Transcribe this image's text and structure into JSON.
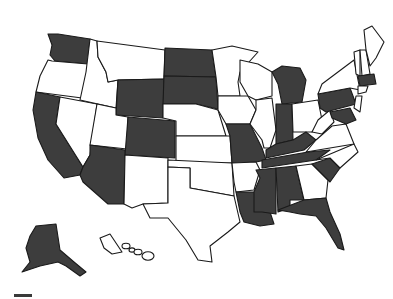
{
  "map": {
    "type": "choropleth",
    "region": "United States",
    "colors": {
      "highlighted": "#3d3d3d",
      "other": "#ffffff",
      "border": "#1a1a1a"
    },
    "highlighted_states": [
      "WA",
      "CA",
      "AZ",
      "WY",
      "CO",
      "ND",
      "SD",
      "MO",
      "MI",
      "IN",
      "KY",
      "TN",
      "MS",
      "AL",
      "LA",
      "FL",
      "SC",
      "PA",
      "MA",
      "MD",
      "AK"
    ],
    "states": [
      {
        "id": "WA",
        "fill": "highlighted",
        "points": "48,34 58,34 90,39 88,64 55,61 50,55 52,45"
      },
      {
        "id": "OR",
        "fill": "other",
        "points": "52,61 88,64 87,72 82,98 36,92 40,76 48,60"
      },
      {
        "id": "CA",
        "fill": "highlighted",
        "points": "36,92 60,97 56,124 83,167 80,175 64,178 48,160 38,138 33,110"
      },
      {
        "id": "NV",
        "fill": "other",
        "points": "60,97 97,104 90,155 83,167 56,124"
      },
      {
        "id": "ID",
        "fill": "other",
        "points": "90,39 97,41 98,57 106,72 108,82 118,80 116,108 80,100 86,72"
      },
      {
        "id": "MT",
        "fill": "other",
        "points": "97,41 165,50 164,79 118,80 108,82 106,72 98,57"
      },
      {
        "id": "WY",
        "fill": "highlighted",
        "points": "118,80 164,79 163,118 116,115"
      },
      {
        "id": "UT",
        "fill": "other",
        "points": "97,104 116,108 116,115 128,117 127,149 90,145"
      },
      {
        "id": "CO",
        "fill": "highlighted",
        "points": "128,117 175,121 175,158 125,155"
      },
      {
        "id": "AZ",
        "fill": "highlighted",
        "points": "90,145 125,150 124,204 108,204 83,182 80,175 83,167 90,155"
      },
      {
        "id": "NM",
        "fill": "other",
        "points": "125,155 168,158 168,203 143,204 132,208 124,204"
      },
      {
        "id": "ND",
        "fill": "highlighted",
        "points": "165,48 212,50 216,77 164,76"
      },
      {
        "id": "SD",
        "fill": "highlighted",
        "points": "164,76 216,77 218,109 196,104 163,104"
      },
      {
        "id": "NE",
        "fill": "other",
        "points": "163,104 196,104 218,110 226,136 176,136 176,121 163,118"
      },
      {
        "id": "KS",
        "fill": "other",
        "points": "176,136 230,136 232,163 176,163"
      },
      {
        "id": "OK",
        "fill": "other",
        "points": "168,160 232,163 234,196 212,192 190,188 190,168 168,167"
      },
      {
        "id": "TX",
        "fill": "other",
        "points": "168,167 190,168 190,188 234,196 240,222 228,232 210,246 212,262 198,260 186,240 168,218 150,218 143,204 168,203"
      },
      {
        "id": "MN",
        "fill": "other",
        "points": "212,50 232,46 258,52 240,72 238,82 240,96 218,96 216,77"
      },
      {
        "id": "IA",
        "fill": "other",
        "points": "218,96 248,96 256,110 250,124 226,124 218,110"
      },
      {
        "id": "MO",
        "fill": "highlighted",
        "points": "226,124 250,124 262,148 266,160 256,162 236,163 232,163 230,136"
      },
      {
        "id": "AR",
        "fill": "other",
        "points": "232,163 256,162 260,170 254,190 236,192 234,182"
      },
      {
        "id": "LA",
        "fill": "highlighted",
        "points": "236,192 256,192 258,210 270,212 274,224 260,226 244,222 240,212"
      },
      {
        "id": "WI",
        "fill": "other",
        "points": "240,60 258,64 272,72 272,96 256,100 248,96 240,82"
      },
      {
        "id": "IL",
        "fill": "other",
        "points": "256,100 272,98 276,130 270,148 264,148 262,140 250,124 256,110"
      },
      {
        "id": "MI",
        "fill": "highlighted",
        "points": "272,72 282,66 300,68 306,80 302,102 282,104 278,84"
      },
      {
        "id": "IN",
        "fill": "highlighted",
        "points": "276,104 292,104 293,140 276,144"
      },
      {
        "id": "OH",
        "fill": "other",
        "points": "292,104 318,100 322,120 312,132 293,132"
      },
      {
        "id": "KY",
        "fill": "highlighted",
        "points": "266,150 276,144 293,140 306,132 316,140 304,150 266,158"
      },
      {
        "id": "TN",
        "fill": "highlighted",
        "points": "262,160 308,152 330,150 316,160 262,168"
      },
      {
        "id": "MS",
        "fill": "highlighted",
        "points": "256,170 276,168 276,214 262,212 254,212 254,192 260,178"
      },
      {
        "id": "AL",
        "fill": "highlighted",
        "points": "276,168 296,166 304,200 290,200 290,208 278,212"
      },
      {
        "id": "GA",
        "fill": "other",
        "points": "296,166 312,164 328,180 326,198 304,200"
      },
      {
        "id": "FL",
        "fill": "highlighted",
        "points": "278,210 304,200 326,198 330,212 340,234 344,250 338,248 326,228 316,216 300,214 290,212"
      },
      {
        "id": "SC",
        "fill": "highlighted",
        "points": "312,164 330,158 340,168 330,182"
      },
      {
        "id": "NC",
        "fill": "other",
        "points": "316,160 354,144 358,152 340,168 330,158"
      },
      {
        "id": "VA",
        "fill": "other",
        "points": "316,140 332,126 346,124 354,144 306,152"
      },
      {
        "id": "WV",
        "fill": "other",
        "points": "318,120 330,110 334,122 322,134 312,132"
      },
      {
        "id": "PA",
        "fill": "highlighted",
        "points": "318,94 350,88 356,104 326,112 320,108"
      },
      {
        "id": "MD",
        "fill": "highlighted",
        "points": "330,112 350,108 356,120 346,124 332,118"
      },
      {
        "id": "NY",
        "fill": "other",
        "points": "318,94 322,84 338,72 354,60 358,80 360,90 350,88"
      },
      {
        "id": "VT",
        "fill": "other",
        "points": "354,52 360,50 360,76 356,74"
      },
      {
        "id": "NH",
        "fill": "other",
        "points": "360,50 366,50 370,74 362,76"
      },
      {
        "id": "ME",
        "fill": "other",
        "points": "366,50 364,30 372,26 384,42 376,58 370,66"
      },
      {
        "id": "MA",
        "fill": "highlighted",
        "points": "358,76 374,74 376,84 360,86"
      },
      {
        "id": "CT",
        "fill": "other",
        "points": "358,86 368,86 366,92 358,94"
      },
      {
        "id": "NJ",
        "fill": "other",
        "points": "356,96 362,96 360,112 354,108"
      },
      {
        "id": "AK",
        "fill": "highlighted",
        "points": "36,226 56,224 60,250 74,262 86,272 80,276 66,266 58,262 40,266 22,272 30,262 26,248 30,236"
      },
      {
        "id": "HI",
        "fill": "other",
        "points": "100,238 110,234 118,246 122,252 112,254 104,248"
      }
    ],
    "legend": {
      "swatch_color": "#3a3a3a"
    }
  }
}
